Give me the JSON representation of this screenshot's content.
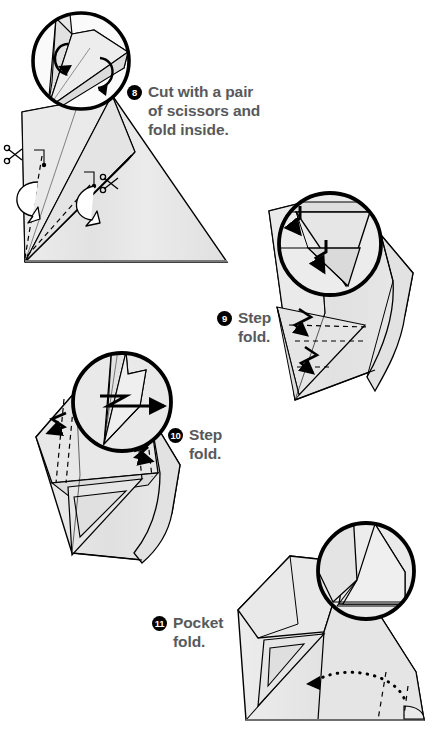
{
  "document": {
    "type": "origami-instruction-diagram",
    "title": "Origami folding steps 8 through 11",
    "background_color": "#ffffff",
    "text_color": "#58595b",
    "badge_color": "#000000",
    "badge_text_color": "#ffffff",
    "paper_fill": "#e6e6e6",
    "paper_fill_light": "#f0f0f0",
    "paper_fill_shadow": "#d8d8d8",
    "line_color": "#000000"
  },
  "steps": [
    {
      "number": "8",
      "caption": "Cut with a pair\nof scissors and\nfold inside.",
      "caption_x": 127,
      "caption_y": 82,
      "icons": [
        "scissors-icon",
        "scissors-icon",
        "rotation-arrow",
        "rotation-arrow"
      ],
      "has_magnifier": true,
      "magnifier": {
        "cx": 80,
        "cy": 60,
        "r": 50
      }
    },
    {
      "number": "9",
      "caption": "Step\nfold.",
      "caption_x": 217,
      "caption_y": 308,
      "icons": [
        "step-fold-arrow",
        "step-fold-arrow",
        "step-fold-arrow",
        "step-fold-arrow"
      ],
      "has_magnifier": true,
      "magnifier": {
        "cx": 330,
        "cy": 242,
        "r": 53
      }
    },
    {
      "number": "10",
      "caption": "Step\nfold.",
      "caption_x": 168,
      "caption_y": 425,
      "icons": [
        "step-fold-arrow",
        "step-fold-arrow",
        "step-fold-arrow"
      ],
      "has_magnifier": true,
      "magnifier": {
        "cx": 120,
        "cy": 400,
        "r": 52
      }
    },
    {
      "number": "11",
      "caption": "Pocket\nfold.",
      "caption_x": 152,
      "caption_y": 613,
      "icons": [
        "dotted-curved-arrow"
      ],
      "has_magnifier": true,
      "magnifier": {
        "cx": 365,
        "cy": 570,
        "r": 52
      }
    }
  ]
}
